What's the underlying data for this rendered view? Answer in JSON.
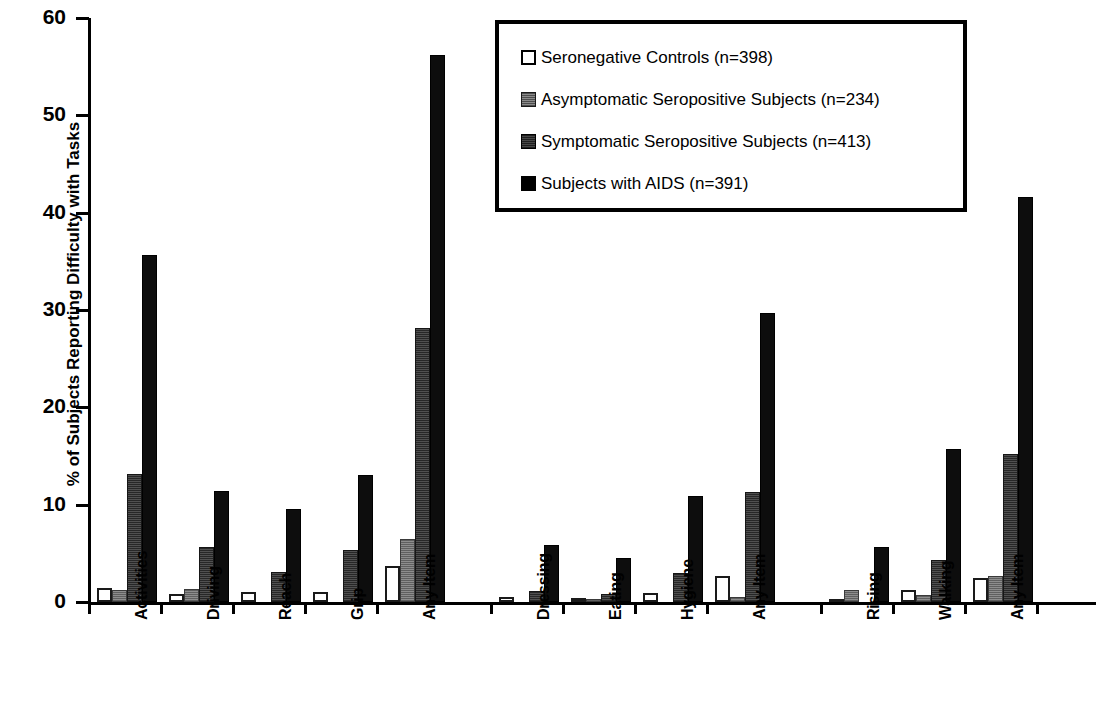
{
  "chart_data": {
    "type": "bar",
    "title": "",
    "xlabel": "",
    "ylabel": "% of Subjects Reporting Difficulty with Tasks",
    "ylim": [
      0,
      60
    ],
    "yticks": [
      0,
      10,
      20,
      30,
      40,
      50,
      60
    ],
    "ytick_labels": [
      "0",
      "10",
      "20",
      "30",
      "40",
      "50",
      "60"
    ],
    "grid": false,
    "legend_position": "top-right",
    "groups": [
      {
        "name": "group-1",
        "categories": [
          "Activities",
          "Driving",
          "Reach",
          "Grip",
          "Any Item"
        ]
      },
      {
        "name": "group-2",
        "categories": [
          "Dressing",
          "Eating",
          "Hygiene",
          "Any Item"
        ]
      },
      {
        "name": "group-3",
        "categories": [
          "Rising",
          "Walking",
          "Any Item"
        ]
      }
    ],
    "categories": [
      "Activities",
      "Driving",
      "Reach",
      "Grip",
      "Any Item",
      "Dressing",
      "Eating",
      "Hygiene",
      "Any Item",
      "Rising",
      "Walking",
      "Any Item"
    ],
    "series": [
      {
        "name": "Seronegative Controls (n=398)",
        "color": "#ffffff",
        "values": [
          1.4,
          0.8,
          1.0,
          1.0,
          3.7,
          0.5,
          0.4,
          0.9,
          2.7,
          0.3,
          1.2,
          2.5
        ]
      },
      {
        "name": "Asymptomatic Seropositive Subjects (n=234)",
        "color": "#7a7a7a",
        "values": [
          1.2,
          1.3,
          0.0,
          0.0,
          6.5,
          0.0,
          0.3,
          0.0,
          0.5,
          1.2,
          0.7,
          2.7
        ]
      },
      {
        "name": "Symptomatic Seropositive Subjects (n=413)",
        "color": "#3c3c3c",
        "values": [
          13.1,
          5.6,
          3.1,
          5.3,
          28.1,
          1.1,
          0.8,
          3.0,
          11.3,
          0.0,
          4.3,
          15.2
        ]
      },
      {
        "name": "Subjects with AIDS (n=391)",
        "color": "#0d0d0d",
        "values": [
          35.6,
          11.4,
          9.6,
          13.0,
          56.2,
          5.9,
          4.5,
          10.9,
          29.7,
          5.7,
          15.7,
          41.6
        ]
      }
    ]
  },
  "legend": {
    "items": [
      {
        "label": "Seronegative Controls (n=398)",
        "swatch": "legend-swatch-seronegative"
      },
      {
        "label": "Asymptomatic Seropositive Subjects (n=234)",
        "swatch": "legend-swatch-asymptomatic"
      },
      {
        "label": "Symptomatic Seropositive Subjects (n=413)",
        "swatch": "legend-swatch-symptomatic"
      },
      {
        "label": "Subjects with AIDS (n=391)",
        "swatch": "legend-swatch-aids"
      }
    ]
  }
}
